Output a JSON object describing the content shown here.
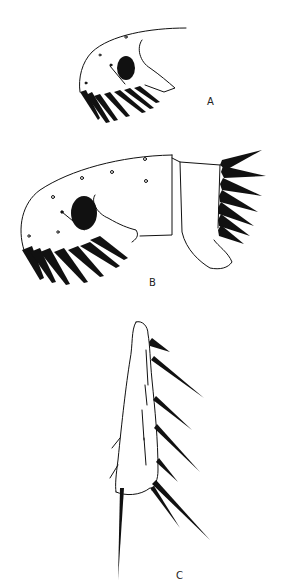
{
  "figure": {
    "panels": [
      {
        "id": "A",
        "label": "A",
        "subject": "head-lateral-view"
      },
      {
        "id": "B",
        "label": "B",
        "subject": "head-and-thoracic-segment-lateral-view"
      },
      {
        "id": "C",
        "label": "C",
        "subject": "leg-segment-with-spines"
      }
    ],
    "colors": {
      "ink": "#111111",
      "background": "#ffffff"
    }
  }
}
